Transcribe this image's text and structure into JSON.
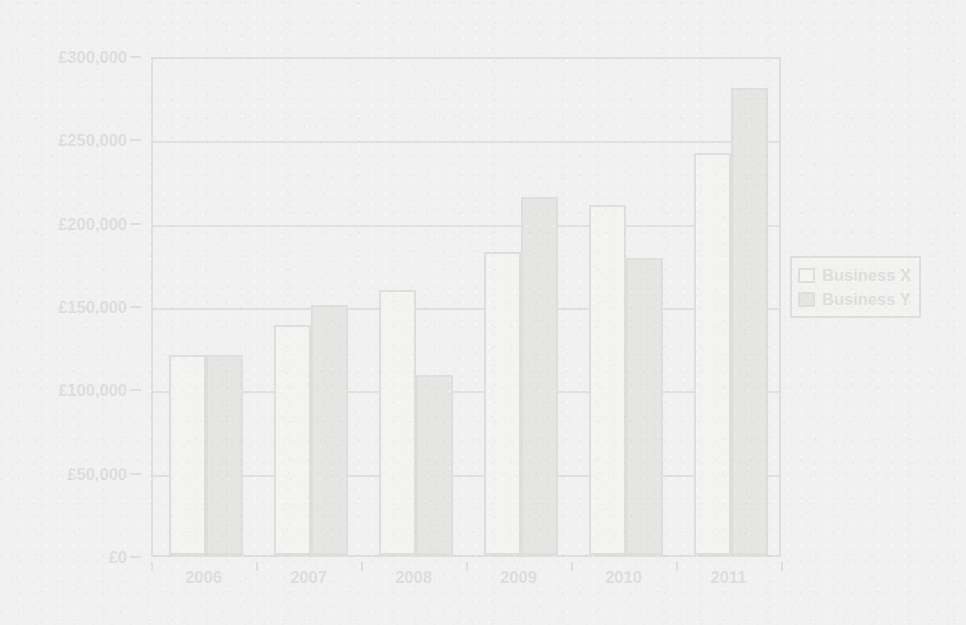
{
  "chart_data": {
    "type": "bar",
    "title": "",
    "xlabel": "",
    "ylabel": "",
    "categories": [
      "2006",
      "2007",
      "2008",
      "2009",
      "2010",
      "2011"
    ],
    "series": [
      {
        "name": "Business X",
        "color": "#fdfdfd",
        "values": [
          120000,
          138000,
          159000,
          182000,
          210000,
          241000
        ]
      },
      {
        "name": "Business Y",
        "color": "#6e6e6e",
        "values": [
          120000,
          150000,
          108000,
          215000,
          178000,
          280000
        ]
      }
    ],
    "ylim": [
      0,
      300000
    ],
    "ytick_values": [
      0,
      50000,
      100000,
      150000,
      200000,
      250000,
      300000
    ],
    "ytick_labels": [
      "£0",
      "£50,000",
      "£100,000",
      "£150,000",
      "£200,000",
      "£250,000",
      "£300,000"
    ],
    "grid": true,
    "legend_position": "right"
  },
  "legend": {
    "entries": [
      {
        "label": "Business X"
      },
      {
        "label": "Business Y"
      }
    ]
  },
  "colors": {
    "background": "#f2f2f1",
    "axis": "#2b2b2b",
    "grid": "#3a3a3a",
    "series_x": "#fdfdfd",
    "series_y": "#6e6e6e",
    "text": "#1c1c1c"
  }
}
